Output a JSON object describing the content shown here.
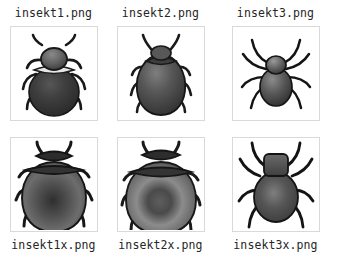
{
  "canvas": {
    "width": 345,
    "height": 262,
    "background": "#ffffff",
    "border_color": "#d9d9d9",
    "text_color": "#262626"
  },
  "grid": {
    "rows": 2,
    "columns": 3,
    "label_position_row1": "above",
    "label_position_row2": "below"
  },
  "items": [
    {
      "label": "insekt1.png",
      "icon": "beetle-round-dark-icon",
      "row": 1,
      "column": 1,
      "label_position": "above",
      "subject": "beetle",
      "description": "round dark beetle, top view, pale pronotum collar",
      "body_color": "#3a3a3a",
      "highlight_color": "#6e6e6e",
      "collar_color": "#e2e2e2"
    },
    {
      "label": "insekt2.png",
      "icon": "beetle-teardrop-icon",
      "row": 1,
      "column": 2,
      "label_position": "above",
      "subject": "beetle",
      "description": "teardrop shaped grey beetle, top view",
      "body_color": "#4a4a4a",
      "highlight_color": "#8a8a8a",
      "collar_color": "#3c3c3c"
    },
    {
      "label": "insekt3.png",
      "icon": "spider-icon",
      "row": 1,
      "column": 3,
      "label_position": "above",
      "subject": "spider",
      "description": "spider with eight long legs, oval abdomen",
      "body_color": "#4a4a4a",
      "highlight_color": "#9a9a9a",
      "collar_color": "#5a5a5a"
    },
    {
      "label": "insekt1x.png",
      "icon": "beetle-round-dark-zoom-icon",
      "row": 2,
      "column": 1,
      "label_position": "below",
      "subject": "beetle",
      "description": "cropped zoom of round beetle, radial shading",
      "body_color": "#4f4f4f",
      "highlight_color": "#7d7d7d",
      "collar_color": "#3a3a3a"
    },
    {
      "label": "insekt2x.png",
      "icon": "beetle-teardrop-zoom-icon",
      "row": 2,
      "column": 2,
      "label_position": "below",
      "subject": "beetle",
      "description": "cropped zoom of teardrop beetle, ring shading",
      "body_color": "#555555",
      "highlight_color": "#8f8f8f",
      "collar_color": "#3a3a3a"
    },
    {
      "label": "insekt3x.png",
      "icon": "spider-zoom-icon",
      "row": 2,
      "column": 3,
      "label_position": "below",
      "subject": "spider",
      "description": "cropped zoom of spider, square head, oval abdomen",
      "body_color": "#4d4d4d",
      "highlight_color": "#8a8a8a",
      "collar_color": "#555555"
    }
  ]
}
